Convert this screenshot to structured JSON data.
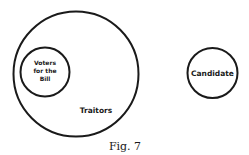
{
  "diagram": {
    "type": "euler-diagram",
    "sets": [
      {
        "id": "traitors",
        "label": "Traitors",
        "contains": [
          "voters"
        ]
      },
      {
        "id": "voters",
        "label_lines": [
          "Voters",
          "for the",
          "Bill"
        ],
        "subset_of": "traitors"
      },
      {
        "id": "candidate",
        "label": "Candidate",
        "disjoint_from": "traitors"
      }
    ],
    "caption": "Fig. 7",
    "stroke_color": "#1a1a1a"
  }
}
